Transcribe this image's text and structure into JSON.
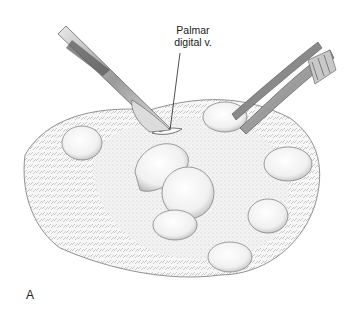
{
  "figure": {
    "panel_letter": "A",
    "annotations": [
      {
        "text_line1": "Palmar",
        "text_line2": "digital v.",
        "target": "incision site at metacarpal pad"
      }
    ],
    "instruments": [
      "scalpel",
      "thumb forceps"
    ],
    "colors": {
      "ink": "#333333",
      "background": "#ffffff",
      "pad_fill": "#f4f4f4"
    }
  }
}
